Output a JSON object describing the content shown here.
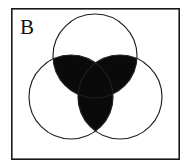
{
  "figure": {
    "panel_label": "B",
    "background_color": "#ffffff",
    "frame_color": "#1a1a1a",
    "outline_color": "#1f1f1f",
    "fill_color": "#0a0a0a",
    "frame": {
      "x": 11,
      "y": 8,
      "width": 169,
      "height": 152
    },
    "label_position": {
      "x": 20,
      "y": 33
    }
  },
  "chart_data": {
    "type": "diagram",
    "diagram_type": "venn",
    "title": "B",
    "set_count": 3,
    "radius": 42,
    "circles": [
      {
        "name": "top-circle",
        "cx": 95,
        "cy": 56,
        "r": 42,
        "filled": false
      },
      {
        "name": "left-circle",
        "cx": 71,
        "cy": 97,
        "r": 42,
        "filled": false
      },
      {
        "name": "right-circle",
        "cx": 120,
        "cy": 97,
        "r": 42,
        "filled": false
      }
    ],
    "shaded_regions": [
      {
        "name": "top-left-intersection",
        "sets": [
          "top-circle",
          "left-circle"
        ],
        "shaded": true
      },
      {
        "name": "top-right-intersection",
        "sets": [
          "top-circle",
          "right-circle"
        ],
        "shaded": true
      },
      {
        "name": "left-right-intersection",
        "sets": [
          "left-circle",
          "right-circle"
        ],
        "shaded": true
      }
    ],
    "unshaded_regions": [
      {
        "name": "top-only",
        "sets": [
          "top-circle"
        ],
        "shaded": false
      },
      {
        "name": "left-only",
        "sets": [
          "left-circle"
        ],
        "shaded": false
      },
      {
        "name": "right-only",
        "sets": [
          "right-circle"
        ],
        "shaded": false
      },
      {
        "name": "outside-all",
        "sets": [],
        "shaded": false
      }
    ],
    "annotation": "Pairwise intersections of three equal circles shaded black"
  }
}
